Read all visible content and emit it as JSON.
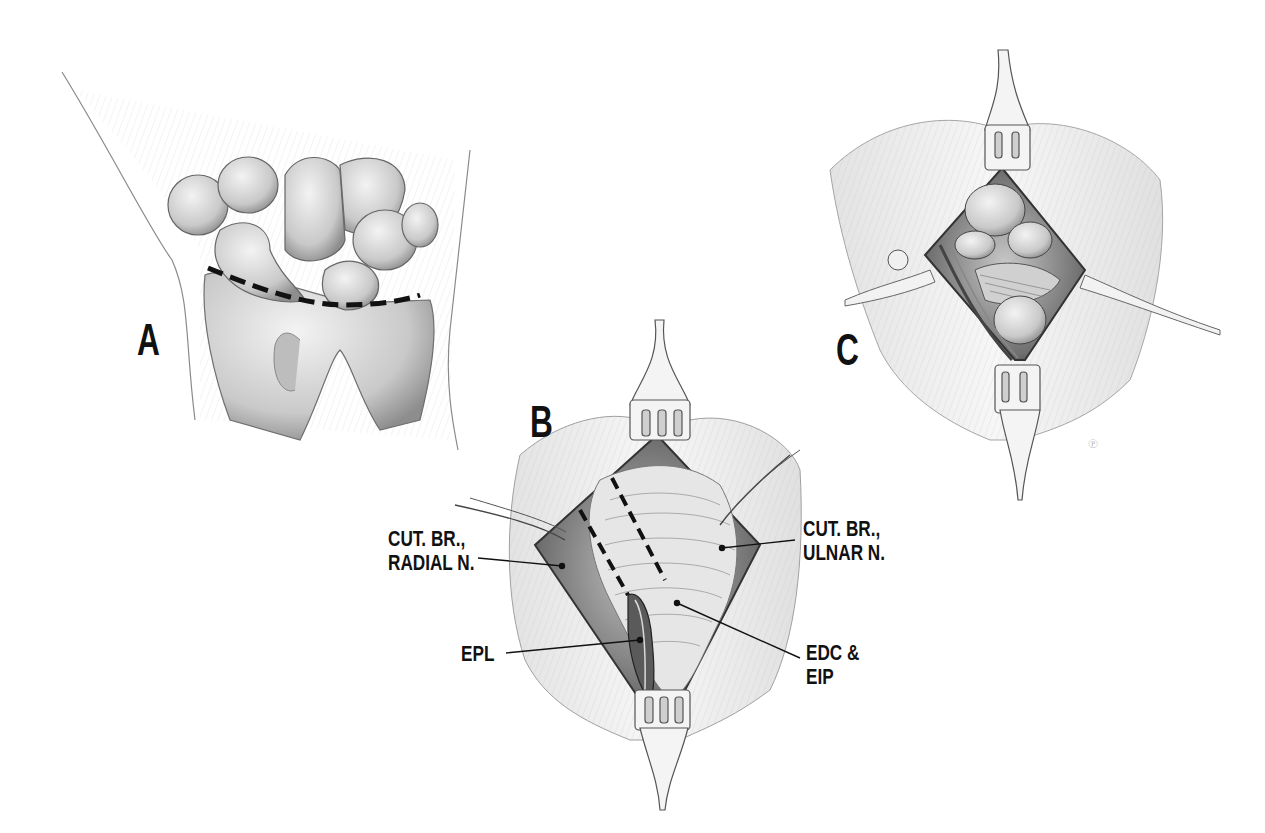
{
  "figure": {
    "panels": [
      {
        "id": "A",
        "letter": "A",
        "description": "Dorsal view of wrist bones with curved dashed incision line"
      },
      {
        "id": "B",
        "letter": "B",
        "description": "Dorsal exposure with retractors showing extensor tendons"
      },
      {
        "id": "C",
        "letter": "C",
        "description": "Deep exposure of carpal bones with retractors"
      }
    ],
    "labels": {
      "cut_br_radial_line1": "CUT. BR.,",
      "cut_br_radial_line2": "RADIAL N.",
      "cut_br_ulnar_line1": "CUT. BR.,",
      "cut_br_ulnar_line2": "ULNAR N.",
      "epl": "EPL",
      "edc_line1": "EDC &",
      "edc_line2": "EIP"
    },
    "colors": {
      "ink": "#111111",
      "sketch": "#555555",
      "shade": "#9a9a9a",
      "background": "#ffffff"
    }
  }
}
